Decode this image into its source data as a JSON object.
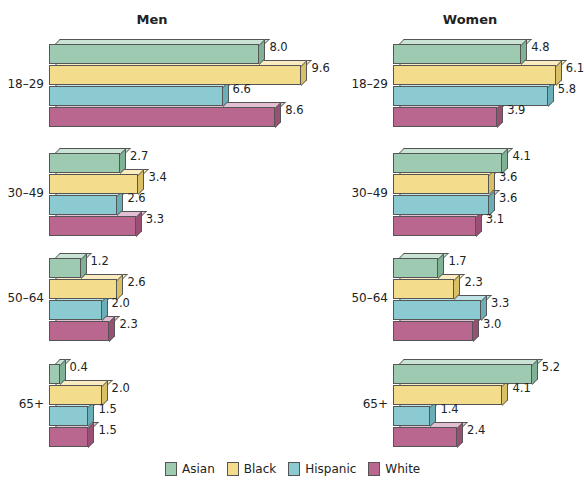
{
  "chart_data": {
    "type": "bar",
    "orientation": "horizontal",
    "style": "3d-beveled",
    "categories": [
      "18–29",
      "30–49",
      "50–64",
      "65+"
    ],
    "panels": [
      {
        "title": "Men",
        "series": [
          {
            "name": "Asian",
            "values": [
              8.0,
              2.7,
              1.2,
              0.4
            ]
          },
          {
            "name": "Black",
            "values": [
              9.6,
              3.4,
              2.6,
              2.0
            ]
          },
          {
            "name": "Hispanic",
            "values": [
              6.6,
              2.6,
              2.0,
              1.5
            ]
          },
          {
            "name": "White",
            "values": [
              8.6,
              3.3,
              2.3,
              1.5
            ]
          }
        ]
      },
      {
        "title": "Women",
        "series": [
          {
            "name": "Asian",
            "values": [
              4.8,
              4.1,
              1.7,
              5.2
            ]
          },
          {
            "name": "Black",
            "values": [
              6.1,
              3.6,
              2.3,
              4.1
            ]
          },
          {
            "name": "Hispanic",
            "values": [
              5.8,
              3.6,
              3.3,
              1.4
            ]
          },
          {
            "name": "White",
            "values": [
              3.9,
              3.1,
              3.0,
              2.4
            ]
          }
        ]
      }
    ],
    "legend": [
      "Asian",
      "Black",
      "Hispanic",
      "White"
    ],
    "legend_position": "bottom",
    "grid": false,
    "xlabel": "",
    "ylabel": ""
  },
  "colors": {
    "Asian": {
      "face": "#9dcab0",
      "top": "#c9e4d4",
      "side": "#7fb295"
    },
    "Black": {
      "face": "#f3dc8c",
      "top": "#faecc0",
      "side": "#d9bf66"
    },
    "Hispanic": {
      "face": "#8ccad2",
      "top": "#bfe2e7",
      "side": "#6aafb8"
    },
    "White": {
      "face": "#b9678f",
      "top": "#e2bfd2",
      "side": "#9a4f74"
    }
  },
  "legend": {
    "items": [
      {
        "label": "Asian"
      },
      {
        "label": "Black"
      },
      {
        "label": "Hispanic"
      },
      {
        "label": "White"
      }
    ]
  }
}
